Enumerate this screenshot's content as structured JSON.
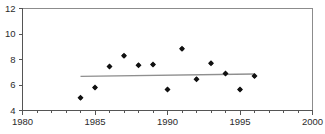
{
  "chart_data": {
    "type": "scatter",
    "title": "",
    "subtitle": "",
    "xlabel": "",
    "ylabel": "",
    "xlim": [
      1980,
      2000
    ],
    "ylim": [
      4,
      12
    ],
    "xticks": [
      1980,
      1985,
      1990,
      1995,
      2000
    ],
    "xticklabels": [
      "1980",
      "1985",
      "1990",
      "1995",
      "2000"
    ],
    "yticks": [
      4,
      6,
      8,
      10,
      12
    ],
    "yticklabels": [
      "4",
      "6",
      "8",
      "10",
      "12"
    ],
    "minor_xticks": [
      1981,
      1982,
      1983,
      1984,
      1986,
      1987,
      1988,
      1989,
      1991,
      1992,
      1993,
      1994,
      1996,
      1997,
      1998,
      1999
    ],
    "grid": false,
    "legend": null,
    "legend_position": "none",
    "marker": "diamond",
    "marker_color": "#111111",
    "series": [
      {
        "name": "observations",
        "x": [
          1984,
          1985,
          1986,
          1987,
          1988,
          1989,
          1990,
          1991,
          1992,
          1993,
          1994,
          1995,
          1996
        ],
        "values": [
          5.0,
          5.8,
          7.45,
          8.3,
          7.55,
          7.6,
          5.65,
          8.85,
          6.45,
          7.7,
          6.9,
          5.65,
          6.7
        ]
      }
    ],
    "trendline": {
      "name": "linear-fit",
      "x": [
        1984,
        1996
      ],
      "values": [
        6.68,
        6.86
      ],
      "color": "#8f8f8f"
    },
    "annotations": []
  },
  "axes": {
    "y_tick_0": "4",
    "y_tick_1": "6",
    "y_tick_2": "8",
    "y_tick_3": "10",
    "y_tick_4": "12",
    "x_tick_0": "1980",
    "x_tick_1": "1985",
    "x_tick_2": "1990",
    "x_tick_3": "1995",
    "x_tick_4": "2000"
  }
}
